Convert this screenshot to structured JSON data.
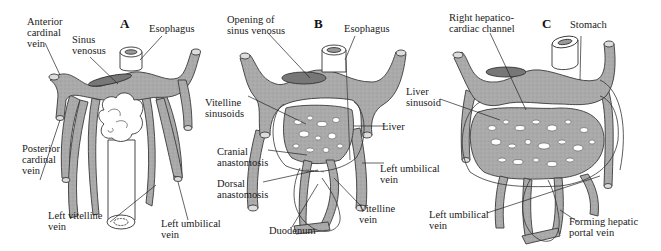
{
  "figure": {
    "colors": {
      "vessel_fill": "#a9a9a9",
      "vessel_stroke": "#3a3a3a",
      "outline": "#333333",
      "background": "#ffffff"
    },
    "panels": [
      {
        "letter": "A",
        "labels": {
          "anterior_cardinal_vein": "Anterior\ncardinal\nvein",
          "sinus_venosus": "Sinus\nvenosus",
          "esophagus": "Esophagus",
          "posterior_cardinal_vein": "Posterior\ncardinal\nvein",
          "left_vitelline_vein": "Left vitelline\nvein",
          "left_umbilical_vein": "Left umbilical\nvein"
        }
      },
      {
        "letter": "B",
        "labels": {
          "opening_of_sinus_venosus": "Opening of\nsinus venosus",
          "esophagus": "Esophagus",
          "vitelline_sinusoids": "Vitelline\nsinusoids",
          "liver": "Liver",
          "cranial_anastomosis": "Cranial\nanastomosis",
          "dorsal_anastomosis": "Dorsal\nanastomosis",
          "left_umbilical_vein": "Left umbilical\nvein",
          "vitelline_vein": "Vitelline\nvein",
          "duodenum": "Duodenum"
        }
      },
      {
        "letter": "C",
        "labels": {
          "right_hepatico_cardiac_channel": "Right hepatico-\ncardiac channel",
          "stomach": "Stomach",
          "liver_sinusoid": "Liver\nsinusoid",
          "left_umbilical_vein": "Left umbilical\nvein",
          "forming_hepatic_portal_vein": "Forming hepatic\nportal vein"
        }
      }
    ]
  }
}
